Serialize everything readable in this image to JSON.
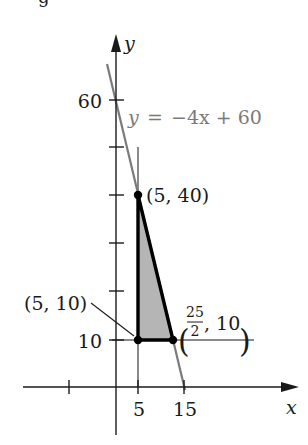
{
  "figure": {
    "top_crop_text": "g",
    "axes": {
      "x_label": "x",
      "y_label": "y",
      "x_ticks": [
        {
          "value": -10,
          "label": ""
        },
        {
          "value": 5,
          "label": "5"
        },
        {
          "value": 15,
          "label": "15"
        }
      ],
      "y_ticks": [
        {
          "value": 10,
          "label": "10"
        },
        {
          "value": 20,
          "label": ""
        },
        {
          "value": 30,
          "label": ""
        },
        {
          "value": 40,
          "label": ""
        },
        {
          "value": 50,
          "label": ""
        },
        {
          "value": 60,
          "label": "60"
        }
      ]
    },
    "line_equation": {
      "lhs": "y",
      "eq": "=",
      "rhs": "−4x + 60"
    },
    "vertices": [
      {
        "name": "top",
        "label": "(5, 40)",
        "x": 5,
        "y": 40
      },
      {
        "name": "bottom-left",
        "label": "(5, 10)",
        "x": 5,
        "y": 10
      },
      {
        "name": "bottom-right",
        "label_num": "25",
        "label_den": "2",
        "label_rest": ", 10",
        "x": 12.5,
        "y": 10
      }
    ],
    "region": {
      "description": "Shaded feasible region bounded by x = 5, y = 10, and y = -4x + 60",
      "fill_color": "#b5b5b5",
      "border_color": "#000000"
    },
    "colors": {
      "axis": "#1a1a1a",
      "constraint_line": "#7a7a7a",
      "region_fill": "#b5b5b5",
      "region_edge": "#000000"
    }
  }
}
